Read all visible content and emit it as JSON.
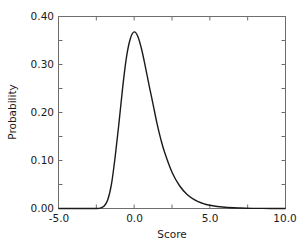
{
  "chart_data": {
    "type": "line",
    "title": "",
    "xlabel": "Score",
    "ylabel": "Probability",
    "xlim": [
      -5.0,
      10.0
    ],
    "ylim": [
      0.0,
      0.4
    ],
    "grid": false,
    "legend": null,
    "x_ticks": [
      "-5.0",
      "0.0",
      "5.0",
      "10.0"
    ],
    "y_ticks": [
      "0.00",
      "0.10",
      "0.20",
      "0.30",
      "0.40"
    ],
    "series": [
      {
        "name": "Probability density",
        "color": "#1a1a1a",
        "x": [
          -5.0,
          -3.0,
          -2.5,
          -2.25,
          -2.0,
          -1.75,
          -1.5,
          -1.25,
          -1.0,
          -0.75,
          -0.5,
          -0.25,
          0.0,
          0.25,
          0.5,
          0.75,
          1.0,
          1.25,
          1.5,
          1.75,
          2.0,
          2.5,
          3.0,
          3.5,
          4.0,
          4.5,
          5.0,
          6.0,
          7.0,
          8.0,
          9.0,
          10.0
        ],
        "y": [
          0.0,
          0.0,
          0.0001,
          0.0008,
          0.0046,
          0.0175,
          0.0507,
          0.1092,
          0.1794,
          0.255,
          0.317,
          0.3543,
          0.3679,
          0.358,
          0.3307,
          0.2936,
          0.2546,
          0.217,
          0.1785,
          0.1457,
          0.1182,
          0.0756,
          0.0474,
          0.0293,
          0.018,
          0.011,
          0.0067,
          0.0025,
          0.0009,
          0.0003,
          0.0001,
          0.0
        ]
      }
    ]
  },
  "axes": {
    "x_title": "Score",
    "y_title": "Probability",
    "x_tick_labels": [
      "-5.0",
      "0.0",
      "5.0",
      "10.0"
    ],
    "y_tick_labels": [
      "0.00",
      "0.10",
      "0.20",
      "0.30",
      "0.40"
    ]
  },
  "colors": {
    "frame": "#6e6e6e",
    "curve": "#1a1a1a",
    "text": "#1a1a1a"
  }
}
